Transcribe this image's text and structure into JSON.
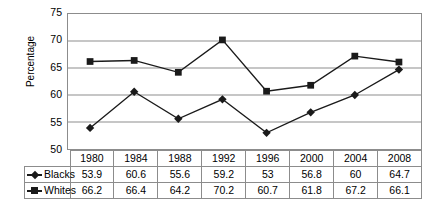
{
  "chart_data": {
    "type": "line",
    "title": "",
    "xlabel": "",
    "ylabel": "Percentage",
    "ylim": [
      50,
      75
    ],
    "yticks": [
      50,
      55,
      60,
      65,
      70,
      75
    ],
    "grid": true,
    "legend_position": "table-left",
    "categories": [
      "1980",
      "1984",
      "1988",
      "1992",
      "1996",
      "2000",
      "2004",
      "2008"
    ],
    "series": [
      {
        "name": "Blacks",
        "marker": "diamond",
        "color": "#1a1a1a",
        "values": [
          53.9,
          60.6,
          55.6,
          59.2,
          53,
          56.8,
          60,
          64.7
        ],
        "labels": [
          "53.9",
          "60.6",
          "55.6",
          "59.2",
          "53",
          "56.8",
          "60",
          "64.7"
        ]
      },
      {
        "name": "Whites",
        "marker": "square",
        "color": "#1a1a1a",
        "values": [
          66.2,
          66.4,
          64.2,
          70.2,
          60.7,
          61.8,
          67.2,
          66.1
        ],
        "labels": [
          "66.2",
          "66.4",
          "64.2",
          "70.2",
          "60.7",
          "61.8",
          "67.2",
          "66.1"
        ]
      }
    ]
  },
  "axis": {
    "y_title": "Percentage",
    "y_tick_labels": [
      "75",
      "70",
      "65",
      "60",
      "55",
      "50"
    ]
  },
  "colors": {
    "line": "#1a1a1a",
    "grid": "#8c8c8c",
    "frame": "#8c8c8c",
    "background": "#ffffff",
    "text": "#000000"
  }
}
